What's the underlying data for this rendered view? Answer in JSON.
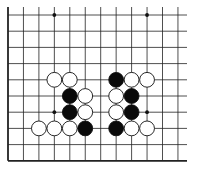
{
  "game": "go",
  "board": {
    "origin_x": 8,
    "origin_y": 15,
    "spacing_x": 15.45,
    "spacing_y": 16.2,
    "cols": 12,
    "rows": 10,
    "edges": [
      "left",
      "bottom"
    ],
    "line_color": "#222222",
    "background": "#ffffff"
  },
  "star_points": [
    {
      "col": 3,
      "row": 0
    },
    {
      "col": 9,
      "row": 0
    },
    {
      "col": 3,
      "row": 6
    },
    {
      "col": 9,
      "row": 6
    }
  ],
  "stones": [
    {
      "col": 3,
      "row": 4,
      "color": "white"
    },
    {
      "col": 4,
      "row": 4,
      "color": "white"
    },
    {
      "col": 7,
      "row": 4,
      "color": "black"
    },
    {
      "col": 8,
      "row": 4,
      "color": "white"
    },
    {
      "col": 9,
      "row": 4,
      "color": "white"
    },
    {
      "col": 4,
      "row": 5,
      "color": "black"
    },
    {
      "col": 5,
      "row": 5,
      "color": "white"
    },
    {
      "col": 7,
      "row": 5,
      "color": "white"
    },
    {
      "col": 8,
      "row": 5,
      "color": "black"
    },
    {
      "col": 4,
      "row": 6,
      "color": "black"
    },
    {
      "col": 5,
      "row": 6,
      "color": "white"
    },
    {
      "col": 7,
      "row": 6,
      "color": "white"
    },
    {
      "col": 8,
      "row": 6,
      "color": "black"
    },
    {
      "col": 2,
      "row": 7,
      "color": "white"
    },
    {
      "col": 3,
      "row": 7,
      "color": "white"
    },
    {
      "col": 4,
      "row": 7,
      "color": "white"
    },
    {
      "col": 5,
      "row": 7,
      "color": "black"
    },
    {
      "col": 7,
      "row": 7,
      "color": "black"
    },
    {
      "col": 8,
      "row": 7,
      "color": "white"
    },
    {
      "col": 9,
      "row": 7,
      "color": "white"
    }
  ]
}
